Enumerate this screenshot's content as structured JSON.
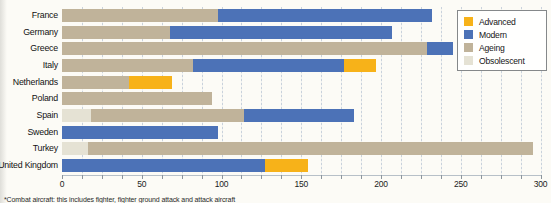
{
  "chart_data": {
    "type": "bar",
    "subtype": "horizontal-stacked",
    "title": "",
    "xlabel": "",
    "ylabel": "",
    "categories": [
      "France",
      "Germany",
      "Greece",
      "Italy",
      "Netherlands",
      "Poland",
      "Spain",
      "Sweden",
      "Turkey",
      "United Kingdom"
    ],
    "series": [
      {
        "name": "Obsolescent",
        "color": "#e5e2d4",
        "values": [
          0,
          0,
          0,
          0,
          0,
          0,
          18,
          0,
          16,
          0
        ]
      },
      {
        "name": "Ageing",
        "color": "#c0b39a",
        "values": [
          98,
          68,
          229,
          82,
          42,
          94,
          96,
          0,
          279,
          0
        ]
      },
      {
        "name": "Modern",
        "color": "#4c72b7",
        "values": [
          134,
          139,
          16,
          95,
          0,
          0,
          69,
          98,
          0,
          127
        ]
      },
      {
        "name": "Advanced",
        "color": "#f7b219",
        "values": [
          0,
          0,
          0,
          20,
          27,
          0,
          0,
          0,
          0,
          27
        ]
      }
    ],
    "xlim": [
      0,
      300
    ],
    "x_ticks": [
      0,
      50,
      100,
      150,
      200,
      250,
      300
    ],
    "minor_grid_step": 12.5,
    "grid": true,
    "legend_position": "top-right"
  },
  "legend": {
    "items": [
      {
        "label": "Advanced",
        "color": "#f7b219"
      },
      {
        "label": "Modern",
        "color": "#4c72b7"
      },
      {
        "label": "Ageing",
        "color": "#c0b39a"
      },
      {
        "label": "Obsolescent",
        "color": "#e5e2d4"
      }
    ]
  },
  "footnote": "*Combat aircraft: this includes fighter, fighter ground attack and attack aircraft"
}
